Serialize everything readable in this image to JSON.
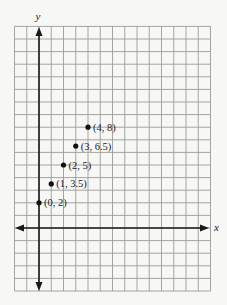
{
  "chart_data": {
    "type": "scatter",
    "title": "",
    "xlabel": "x",
    "ylabel": "y",
    "grid": true,
    "xlim": [
      -2,
      14
    ],
    "ylim": [
      -5,
      16
    ],
    "points": [
      {
        "x": 0,
        "y": 2,
        "label": "(0, 2)"
      },
      {
        "x": 1,
        "y": 3.5,
        "label": "(1, 3.5)"
      },
      {
        "x": 2,
        "y": 5,
        "label": "(2, 5)"
      },
      {
        "x": 3,
        "y": 6.5,
        "label": "(3, 6.5)"
      },
      {
        "x": 4,
        "y": 8,
        "label": "(4, 8)"
      }
    ],
    "legend": null
  },
  "axes": {
    "x_label": "x",
    "y_label": "y"
  },
  "colors": {
    "grid": "#9a9a9a",
    "axis": "#1a1a1a",
    "point": "#111111",
    "background": "#f7f7f5"
  }
}
